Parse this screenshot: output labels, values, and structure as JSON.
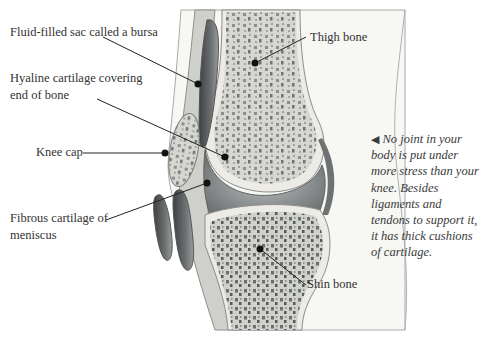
{
  "figure": {
    "top_text_fragment": "…e of the knee joint",
    "labels": {
      "bursa": "Fluid-filled sac called a bursa",
      "hyaline_line1": "Hyaline cartilage covering",
      "hyaline_line2": "end of bone",
      "knee_cap": "Knee cap",
      "meniscus_line1": "Fibrous cartilage of",
      "meniscus_line2": "meniscus",
      "thigh_bone": "Thigh bone",
      "shin_bone": "Shin bone"
    },
    "caption": {
      "arrow_icon": "◀",
      "text": "No joint in your body is put under more stress than your knee. Besides ligaments and tendons to support it, it has thick cushions of cartilage."
    },
    "colors": {
      "bone": "#d9d9d2",
      "bone_pore": "#7a7f80",
      "cartilage": "#ecece6",
      "joint_space": "#8d9193",
      "bursa": "#4a4e50",
      "soft_tissue": "#c9cbc7",
      "skin_outline": "#9a9a9a",
      "leader_line": "#222222"
    }
  }
}
